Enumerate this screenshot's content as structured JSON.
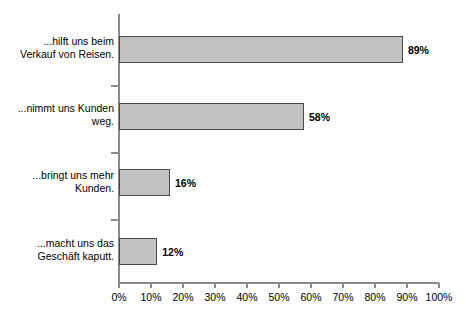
{
  "chart_data": {
    "type": "bar",
    "orientation": "horizontal",
    "title": "",
    "subtitle": "",
    "xlabel": "",
    "ylabel": "",
    "xlim": [
      0,
      100
    ],
    "grid": false,
    "legend": null,
    "categories": [
      "...hilft uns beim Verkauf von Reisen.",
      "...nimmt uns Kunden weg.",
      "...bringt uns mehr Kunden.",
      "...macht uns das Geschäft kaputt."
    ],
    "category_lines": [
      [
        "...hilft uns beim",
        "Verkauf von Reisen."
      ],
      [
        "...nimmt uns Kunden",
        "weg."
      ],
      [
        "...bringt uns mehr",
        "Kunden."
      ],
      [
        "...macht uns das",
        "Geschäft kaputt."
      ]
    ],
    "values": [
      89,
      58,
      16,
      12
    ],
    "value_labels": [
      "89%",
      "58%",
      "16%",
      "12%"
    ],
    "x_ticks": [
      0,
      10,
      20,
      30,
      40,
      50,
      60,
      70,
      80,
      90,
      100
    ],
    "x_tick_labels": [
      "0%",
      "10%",
      "20%",
      "30%",
      "40%",
      "50%",
      "60%",
      "70%",
      "80%",
      "90%",
      "100%"
    ],
    "colors": {
      "bar_fill": "#c2c2c2",
      "bar_border": "#4a4a4a",
      "axis": "#8a8a8a",
      "text": "#000000",
      "background": "#ffffff"
    }
  }
}
